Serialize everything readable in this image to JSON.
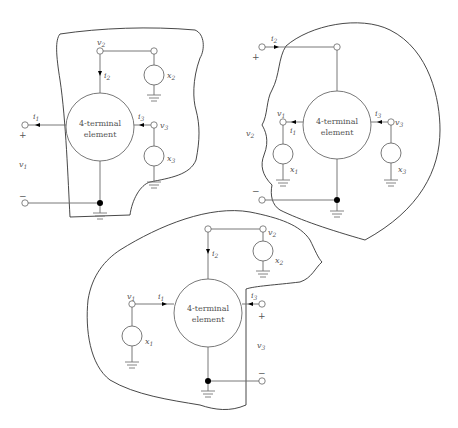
{
  "diagram": {
    "element_label_line1": "4-terminal",
    "element_label_line2": "element",
    "colors": {
      "wire": "#6a6a6a",
      "outline": "#333333",
      "node": "#000000",
      "background": "#ffffff"
    },
    "panels": [
      {
        "id": "top-left",
        "driven_port": "port 1",
        "labels": {
          "v_port": "v",
          "v_port_sub": "1",
          "i_port": "i",
          "i_port_sub": "1",
          "plus": "+",
          "minus": "−",
          "v2": "v",
          "v2_sub": "2",
          "i2": "i",
          "i2_sub": "2",
          "x2": "x",
          "x2_sub": "2",
          "v3": "v",
          "v3_sub": "3",
          "i3": "i",
          "i3_sub": "3",
          "x3": "x",
          "x3_sub": "3"
        }
      },
      {
        "id": "top-right",
        "driven_port": "port 2",
        "labels": {
          "v_port": "v",
          "v_port_sub": "2",
          "i_port": "i",
          "i_port_sub": "2",
          "plus": "+",
          "minus": "−",
          "v1": "v",
          "v1_sub": "1",
          "i1": "i",
          "i1_sub": "1",
          "x1": "x",
          "x1_sub": "1",
          "v3": "v",
          "v3_sub": "3",
          "i3": "i",
          "i3_sub": "3",
          "x3": "x",
          "x3_sub": "3"
        }
      },
      {
        "id": "bottom",
        "driven_port": "port 3",
        "labels": {
          "v_port": "v",
          "v_port_sub": "3",
          "i_port": "i",
          "i_port_sub": "3",
          "plus": "+",
          "minus": "−",
          "v1": "v",
          "v1_sub": "1",
          "i1": "i",
          "i1_sub": "1",
          "x1": "x",
          "x1_sub": "1",
          "v2": "v",
          "v2_sub": "2",
          "i2": "i",
          "i2_sub": "2",
          "x2": "x",
          "x2_sub": "2"
        }
      }
    ]
  }
}
